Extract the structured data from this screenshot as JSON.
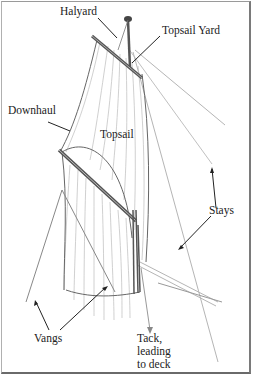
{
  "diagram": {
    "labels": {
      "halyard": "Halyard",
      "topsail_yard": "Topsail Yard",
      "downhaul": "Downhaul",
      "topsail": "Topsail",
      "stays": "Stays",
      "vangs": "Vangs",
      "tack_line1": "Tack,",
      "tack_line2": "leading",
      "tack_line3": "to deck"
    },
    "colors": {
      "line": "#333333",
      "sail_hatch": "#b8b8b8",
      "spar": "#555555",
      "frame": "#7a7a7a"
    }
  }
}
